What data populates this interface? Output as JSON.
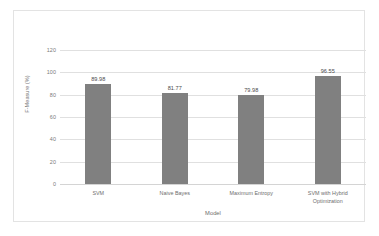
{
  "chart_data": {
    "type": "bar",
    "title": "",
    "categories": [
      "SVM",
      "Naive Bayes",
      "Maximum Entropy",
      "SVM with Hybrid\nOptimization"
    ],
    "values": [
      89.98,
      81.77,
      79.98,
      96.55
    ],
    "value_labels": [
      "89.98",
      "81.77",
      "79.98",
      "96.55"
    ],
    "xlabel": "Model",
    "ylabel": "F-Measure (%)",
    "ylim": [
      0,
      120
    ],
    "ytick_labels": [
      "0",
      "20",
      "40",
      "60",
      "80",
      "100",
      "120"
    ],
    "ytick_values": [
      0,
      20,
      40,
      60,
      80,
      100,
      120
    ],
    "grid": "horizontal",
    "legend": "none",
    "bar_color": "#808080",
    "gridline_color": "#e0e0e0",
    "frame_color": "#e3e3e3",
    "background_color": "#ffffff",
    "text_color": "#6e6e6e"
  }
}
